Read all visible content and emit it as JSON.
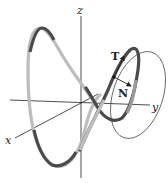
{
  "diagram": {
    "axes": {
      "x_label": "x",
      "y_label": "y",
      "z_label": "z"
    },
    "vectors": {
      "tangent_label": "T",
      "normal_label": "N"
    },
    "colors": {
      "axis": "#222222",
      "curve_dark": "#4a4a4a",
      "curve_light": "#bdbdbd",
      "circle": "#555555"
    }
  }
}
